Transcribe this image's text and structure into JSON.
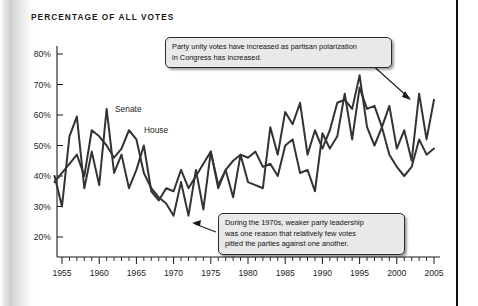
{
  "title": "PERCENTAGE OF ALL VOTES",
  "callouts": {
    "top": {
      "line1": "Party unity votes have increased as partisan polarization",
      "line2": "in Congress has increased."
    },
    "bottom": {
      "line1": "During the 1970s, weaker party leadership",
      "line2": "was one reason that relatively few votes",
      "line3": "pitted the parties against one another."
    }
  },
  "series_labels": {
    "senate": "Senate",
    "house": "House"
  },
  "colors": {
    "line": "#333333",
    "callout_bg": "#e9e9e9",
    "callout_border": "#2b2b2b",
    "axis": "#1a1a1a",
    "rule": "#111111"
  },
  "chart_data": {
    "type": "line",
    "title": "PERCENTAGE OF ALL VOTES",
    "xlabel": "",
    "ylabel": "",
    "xlim": [
      1954,
      2005
    ],
    "ylim": [
      17,
      83
    ],
    "grid": false,
    "legend": "inline-labels",
    "ytick_labels": [
      "20%",
      "30%",
      "40%",
      "50%",
      "60%",
      "70%",
      "80%"
    ],
    "ytick_values": [
      20,
      30,
      40,
      50,
      60,
      70,
      80
    ],
    "xtick_labels": [
      "1955",
      "1960",
      "1965",
      "1970",
      "1975",
      "1980",
      "1985",
      "1990",
      "1995",
      "2000",
      "2005"
    ],
    "xtick_values": [
      1955,
      1960,
      1965,
      1970,
      1975,
      1980,
      1985,
      1990,
      1995,
      2000,
      2005
    ],
    "x": [
      1954,
      1955,
      1956,
      1957,
      1958,
      1959,
      1960,
      1961,
      1962,
      1963,
      1964,
      1965,
      1966,
      1967,
      1968,
      1969,
      1970,
      1971,
      1972,
      1973,
      1974,
      1975,
      1976,
      1977,
      1978,
      1979,
      1980,
      1981,
      1982,
      1983,
      1984,
      1985,
      1986,
      1987,
      1988,
      1989,
      1990,
      1991,
      1992,
      1993,
      1994,
      1995,
      1996,
      1997,
      1998,
      1999,
      2000,
      2001,
      2002,
      2003,
      2004,
      2005
    ],
    "series": [
      {
        "name": "Senate",
        "values": [
          40,
          30,
          53,
          59.5,
          36,
          48,
          37,
          62,
          41,
          47,
          36,
          42,
          50,
          35,
          32,
          36,
          35,
          42,
          36,
          40,
          44,
          48,
          37,
          42,
          45,
          47,
          46,
          48,
          43,
          44,
          40,
          50,
          52,
          41,
          42,
          35,
          54,
          49,
          53,
          67,
          52,
          69,
          62,
          63,
          56,
          63,
          49,
          55,
          45,
          67,
          52,
          65
        ]
      },
      {
        "name": "House",
        "values": [
          38,
          41,
          44,
          47,
          40,
          55,
          53,
          50,
          46,
          49,
          55,
          52,
          41,
          36,
          33,
          31,
          27,
          38,
          27,
          42,
          29,
          48,
          36,
          42,
          33,
          47,
          38,
          37,
          36,
          56,
          47,
          61,
          57,
          64,
          47,
          55,
          49,
          55,
          64,
          65,
          62,
          73,
          56,
          50,
          56,
          47,
          43,
          40,
          43,
          52,
          47,
          49
        ]
      }
    ],
    "annotations": [
      {
        "text": "Party unity votes have increased as partisan polarization in Congress has increased.",
        "points_to": [
          2003,
          67
        ]
      },
      {
        "text": "During the 1970s, weaker party leadership was one reason that relatively few votes pitted the parties against one another.",
        "points_to": [
          1972,
          27
        ]
      }
    ]
  }
}
